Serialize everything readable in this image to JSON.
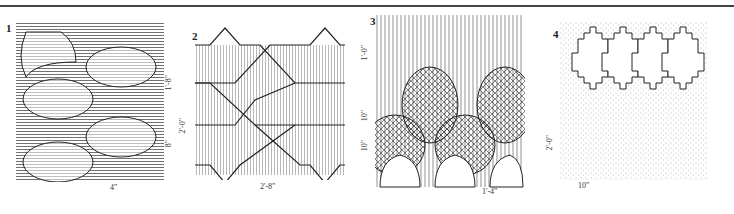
{
  "figure": {
    "panels": [
      {
        "number": "1",
        "pattern": "ogee lantern tiles with horizontal hatching",
        "dimensions": {
          "vertical_1": "1'-8\"",
          "vertical_2": "8\"",
          "vertical_3": "2'-0\"",
          "horizontal": "4\""
        }
      },
      {
        "number": "2",
        "pattern": "interlocking chevron/zigzag bands with vertical hatching",
        "dimensions": {
          "horizontal": "2'-8\""
        }
      },
      {
        "number": "3",
        "pattern": "overlapping fish-scale arches with cross-hatching",
        "dimensions": {
          "vertical_1": "1'-0\"",
          "vertical_2": "10\"",
          "vertical_3": "10\"",
          "horizontal": "1'-4\""
        }
      },
      {
        "number": "4",
        "pattern": "stepped diamond tiles with stippled shading",
        "dimensions": {
          "vertical": "2'-0\"",
          "horizontal": "10\""
        }
      }
    ]
  },
  "colors": {
    "ink": "#222222",
    "rule": "#444444",
    "paper": "#ffffff"
  }
}
